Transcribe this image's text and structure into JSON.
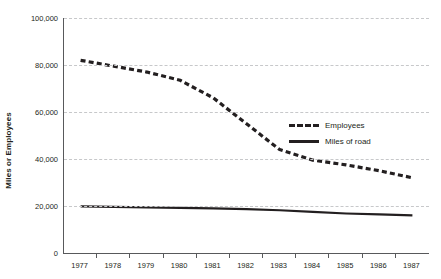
{
  "chart_data": {
    "type": "line",
    "title": "",
    "xlabel": "",
    "ylabel": "Miles or Employees",
    "x": [
      "1977",
      "1978",
      "1979",
      "1980",
      "1981",
      "1982",
      "1983",
      "1984",
      "1985",
      "1986",
      "1987"
    ],
    "categories": [
      "1977",
      "1978",
      "1979",
      "1980",
      "1981",
      "1982",
      "1983",
      "1984",
      "1985",
      "1986",
      "1987"
    ],
    "ylim": [
      0,
      100000
    ],
    "yticks": [
      0,
      20000,
      40000,
      60000,
      80000,
      100000
    ],
    "ytick_labels": [
      "0",
      "20,000",
      "40,000",
      "60,000",
      "80,000",
      "100,000"
    ],
    "grid": true,
    "legend_position": "center-right",
    "series": [
      {
        "name": "Employees",
        "style": "dashed",
        "color": "#231f20",
        "values": [
          82000,
          79500,
          77000,
          73500,
          66000,
          55000,
          44000,
          39500,
          37500,
          35000,
          32000
        ]
      },
      {
        "name": "Miles of road",
        "style": "solid",
        "color": "#231f20",
        "values": [
          19800,
          19600,
          19400,
          19200,
          19000,
          18700,
          18200,
          17500,
          16800,
          16400,
          16000
        ]
      }
    ]
  },
  "axis": {
    "y_title": "Miles or Employees"
  },
  "legend": {
    "items": [
      {
        "label": "Employees",
        "style": "dashed"
      },
      {
        "label": "Miles of road",
        "style": "solid"
      }
    ]
  }
}
